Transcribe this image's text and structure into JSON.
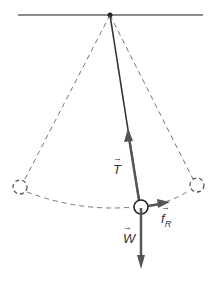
{
  "diagram": {
    "colors": {
      "ceiling": "#555555",
      "string": "#333333",
      "dashed": "#777777",
      "arrow": "#555555",
      "bob": "#222222"
    },
    "labels": {
      "tension": "T",
      "weight": "W",
      "friction": "f",
      "friction_sub": "R"
    }
  }
}
